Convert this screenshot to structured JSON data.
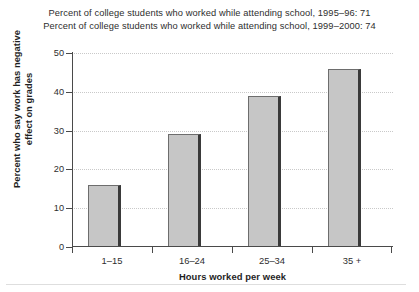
{
  "chart_data": {
    "type": "bar",
    "title": "",
    "title_lines": [
      "Percent of college students who worked while attending school, 1995–96: 71",
      "Percent of college students who worked while attending school, 1999–2000: 74"
    ],
    "categories": [
      "1–15",
      "16–24",
      "25–34",
      "35 +"
    ],
    "values": [
      16,
      29,
      39,
      46
    ],
    "series": [
      {
        "name": "Percent who say work has negative effect on grades",
        "values": [
          16,
          29,
          39,
          46
        ]
      }
    ],
    "xlabel": "Hours worked per week",
    "ylabel": "Percent who say work has negative effect on grades",
    "ylabel_line1": "Percent who say work has negative",
    "ylabel_line2": "effect on grades",
    "ylim": [
      0,
      50
    ],
    "ytick_values": [
      0,
      10,
      20,
      30,
      40,
      50
    ],
    "ytick_labels": [
      "0",
      "10",
      "20",
      "30",
      "40",
      "50"
    ],
    "grid": "horizontal-dotted",
    "legend": "none",
    "bar_color": "#c6c6c6",
    "bar_edge_color": "#6d6d6d",
    "bar_shadow_color": "#3a3a3a",
    "axis_color": "#4a4a4a",
    "grid_color": "#c9c9c9",
    "background_color": "#ffffff"
  }
}
